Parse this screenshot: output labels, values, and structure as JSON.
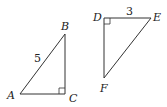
{
  "figure": {
    "triangle_abc": {
      "vertices": {
        "A": {
          "label": "A",
          "x": 20,
          "y": 94
        },
        "B": {
          "label": "B",
          "x": 65,
          "y": 34
        },
        "C": {
          "label": "C",
          "x": 65,
          "y": 94
        }
      },
      "right_angle_at": "C",
      "side_labels": {
        "AB": "5"
      }
    },
    "triangle_def": {
      "vertices": {
        "D": {
          "label": "D",
          "x": 104,
          "y": 18
        },
        "E": {
          "label": "E",
          "x": 151,
          "y": 18
        },
        "F": {
          "label": "F",
          "x": 104,
          "y": 78
        }
      },
      "right_angle_at": "D",
      "side_labels": {
        "DE": "3"
      }
    },
    "stroke_color": "#333333"
  }
}
